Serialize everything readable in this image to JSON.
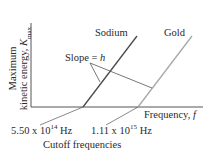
{
  "diagram": {
    "y_axis": {
      "line1": "Maximum",
      "line2": "kinetic energy, ",
      "symbol": "K",
      "subscript": "max"
    },
    "x_axis": {
      "label": "Frequency, ",
      "symbol": "f"
    },
    "lines": [
      {
        "name": "Sodium",
        "color": "#4a4a4a"
      },
      {
        "name": "Gold",
        "color": "#a8a8a8"
      }
    ],
    "slope_label": {
      "prefix": "Slope = ",
      "symbol": "h"
    },
    "cutoffs": [
      {
        "mantissa": "5.50 x 10",
        "exponent": "14",
        "unit": " Hz"
      },
      {
        "mantissa": "1.11 x 10",
        "exponent": "15",
        "unit": " Hz"
      }
    ],
    "cutoff_caption": "Cutoff frequencies"
  }
}
